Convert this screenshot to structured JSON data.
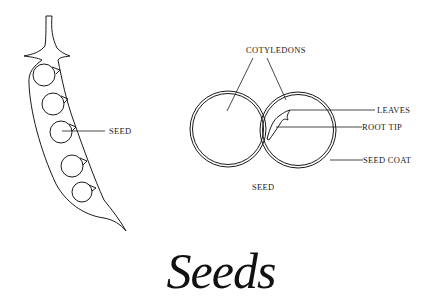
{
  "title": "Seeds",
  "pod_diagram": {
    "seed_label": "SEED",
    "seed_count": 5
  },
  "seed_cross_section": {
    "labels": {
      "cotyledons": "COTYLEDONS",
      "leaves": "LEAVES",
      "root_tip": "ROOT TIP",
      "seed_coat": "SEED COAT",
      "caption": "SEED"
    }
  },
  "colors": {
    "ink": "#1a1a1a",
    "background": "#ffffff"
  }
}
